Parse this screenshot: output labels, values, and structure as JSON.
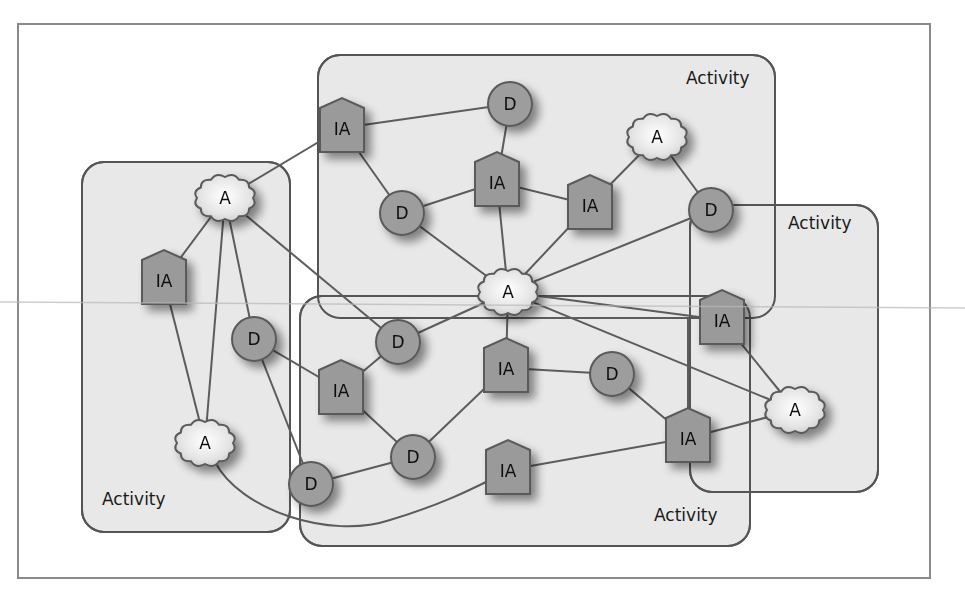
{
  "diagram": {
    "title": "",
    "legend": {
      "A": "cloud-shaped node",
      "IA": "pentagon (house-shaped) node",
      "D": "circle node"
    },
    "activities": [
      {
        "id": "act-left",
        "label": "Activity",
        "x": 82,
        "y": 162,
        "w": 208,
        "h": 370,
        "label_x": 102,
        "label_y": 505
      },
      {
        "id": "act-top",
        "label": "Activity",
        "x": 318,
        "y": 55,
        "w": 457,
        "h": 263,
        "label_x": 686,
        "label_y": 84
      },
      {
        "id": "act-bottom",
        "label": "Activity",
        "x": 300,
        "y": 296,
        "w": 450,
        "h": 250,
        "label_x": 654,
        "label_y": 521
      },
      {
        "id": "act-right",
        "label": "Activity",
        "x": 690,
        "y": 205,
        "w": 188,
        "h": 287,
        "label_x": 788,
        "label_y": 229
      }
    ],
    "nodes": [
      {
        "id": "A1",
        "type": "A",
        "label": "A",
        "x": 225,
        "y": 198
      },
      {
        "id": "A2",
        "type": "A",
        "label": "A",
        "x": 205,
        "y": 443
      },
      {
        "id": "A3",
        "type": "A",
        "label": "A",
        "x": 657,
        "y": 137
      },
      {
        "id": "A4",
        "type": "A",
        "label": "A",
        "x": 508,
        "y": 292
      },
      {
        "id": "A5",
        "type": "A",
        "label": "A",
        "x": 795,
        "y": 410
      },
      {
        "id": "IA1",
        "type": "IA",
        "label": "IA",
        "x": 342,
        "y": 128
      },
      {
        "id": "IA2",
        "type": "IA",
        "label": "IA",
        "x": 497,
        "y": 182
      },
      {
        "id": "IA3",
        "type": "IA",
        "label": "IA",
        "x": 590,
        "y": 205
      },
      {
        "id": "IA4",
        "type": "IA",
        "label": "IA",
        "x": 164,
        "y": 280
      },
      {
        "id": "IA5",
        "type": "IA",
        "label": "IA",
        "x": 341,
        "y": 390
      },
      {
        "id": "IA6",
        "type": "IA",
        "label": "IA",
        "x": 506,
        "y": 368
      },
      {
        "id": "IA7",
        "type": "IA",
        "label": "IA",
        "x": 722,
        "y": 320
      },
      {
        "id": "IA8",
        "type": "IA",
        "label": "IA",
        "x": 688,
        "y": 438
      },
      {
        "id": "IA9",
        "type": "IA",
        "label": "IA",
        "x": 508,
        "y": 470
      },
      {
        "id": "D1",
        "type": "D",
        "label": "D",
        "x": 510,
        "y": 104
      },
      {
        "id": "D2",
        "type": "D",
        "label": "D",
        "x": 402,
        "y": 213
      },
      {
        "id": "D3",
        "type": "D",
        "label": "D",
        "x": 711,
        "y": 210
      },
      {
        "id": "D4",
        "type": "D",
        "label": "D",
        "x": 254,
        "y": 339
      },
      {
        "id": "D5",
        "type": "D",
        "label": "D",
        "x": 398,
        "y": 342
      },
      {
        "id": "D6",
        "type": "D",
        "label": "D",
        "x": 612,
        "y": 374
      },
      {
        "id": "D7",
        "type": "D",
        "label": "D",
        "x": 413,
        "y": 457
      },
      {
        "id": "D8",
        "type": "D",
        "label": "D",
        "x": 311,
        "y": 484
      }
    ],
    "edges": [
      [
        "A1",
        "IA1"
      ],
      [
        "A1",
        "IA4"
      ],
      [
        "A1",
        "A2"
      ],
      [
        "A1",
        "D4"
      ],
      [
        "A1",
        "D5"
      ],
      [
        "IA4",
        "A2"
      ],
      [
        "IA1",
        "D1"
      ],
      [
        "IA1",
        "D2"
      ],
      [
        "D1",
        "IA2"
      ],
      [
        "D2",
        "IA2"
      ],
      [
        "D2",
        "A4"
      ],
      [
        "IA2",
        "IA3"
      ],
      [
        "IA2",
        "A4"
      ],
      [
        "IA3",
        "A3"
      ],
      [
        "IA3",
        "A4"
      ],
      [
        "A3",
        "D3"
      ],
      [
        "D3",
        "A4"
      ],
      [
        "A4",
        "D5"
      ],
      [
        "A4",
        "IA6"
      ],
      [
        "A4",
        "IA7"
      ],
      [
        "A4",
        "A5"
      ],
      [
        "D4",
        "IA5"
      ],
      [
        "D4",
        "D8"
      ],
      [
        "D5",
        "IA5"
      ],
      [
        "IA5",
        "D7"
      ],
      [
        "IA6",
        "D6"
      ],
      [
        "IA6",
        "D7"
      ],
      [
        "D6",
        "IA8"
      ],
      [
        "D7",
        "D8"
      ],
      [
        "IA7",
        "A5"
      ],
      [
        "IA8",
        "A5"
      ],
      [
        "IA8",
        "IA9"
      ],
      [
        "IA8",
        "A4",
        "elbow"
      ]
    ],
    "curves": [
      {
        "from": "A2",
        "to": "IA9",
        "path": "M215,462 C 240,510 330,540 390,520 C 440,505 470,490 490,480"
      }
    ]
  },
  "colors": {
    "frame_border": "#8a8a8a",
    "activity_fill": "#e8e8e8",
    "activity_border": "#555555",
    "node_fill": "#9c9c9c",
    "node_border": "#5a5a5a",
    "cloud_fill_center": "#ffffff",
    "cloud_fill_edge": "#cfcfcf",
    "edge": "#5c5c5c",
    "text": "#111111"
  }
}
